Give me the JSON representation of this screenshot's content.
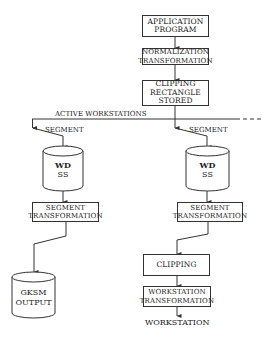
{
  "diagram": {
    "nodes": {
      "application_program": "APPLICATION PROGRAM",
      "normalization_transformation": "NORMALIZATION TRANSFORMATION",
      "clipping_rectangle_stored": "CLIPPING RECTANGLE STORED",
      "left_wdss": "WD SS",
      "right_wdss": "WD SS",
      "left_segment_transformation": "SEGMENT TRANSFORMATION",
      "right_segment_transformation": "SEGMENT TRANSFORMATION",
      "gksm_output": "GKSM OUTPUT",
      "clipping": "CLIPPING",
      "workstation_transformation": "WORKSTATION TRANSFORMATION",
      "workstation": "WORKSTATION"
    },
    "labels": {
      "active_workstations": "ACTIVE WORKSTATIONS",
      "left_segment": "SEGMENT",
      "right_segment": "SEGMENT"
    },
    "lines": {
      "app": [
        "APPLICATION",
        "PROGRAM"
      ],
      "norm": [
        "NORMALIZATION",
        "TRANSFORMATION"
      ],
      "clip_rect": [
        "CLIPPING",
        "RECTANGLE",
        "STORED"
      ],
      "wdss": [
        "WD",
        "SS"
      ],
      "seg_trans": [
        "SEGMENT",
        "TRANSFORMATION"
      ],
      "gksm": [
        "GKSM",
        "OUTPUT"
      ],
      "ws_trans": [
        "WORKSTATION",
        "TRANSFORMATION"
      ]
    },
    "edges": [
      [
        "application_program",
        "normalization_transformation"
      ],
      [
        "normalization_transformation",
        "clipping_rectangle_stored"
      ],
      [
        "clipping_rectangle_stored",
        "active_workstations_bus"
      ],
      [
        "active_workstations_bus",
        "left_wdss"
      ],
      [
        "active_workstations_bus",
        "right_wdss"
      ],
      [
        "left_wdss",
        "left_segment_transformation"
      ],
      [
        "right_wdss",
        "right_segment_transformation"
      ],
      [
        "left_segment_transformation",
        "gksm_output"
      ],
      [
        "right_segment_transformation",
        "clipping"
      ],
      [
        "clipping",
        "workstation_transformation"
      ],
      [
        "workstation_transformation",
        "workstation"
      ]
    ]
  }
}
